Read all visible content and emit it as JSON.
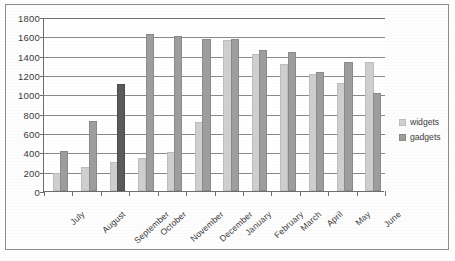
{
  "chart_data": {
    "type": "bar",
    "title": "",
    "xlabel": "",
    "ylabel": "",
    "ylim": [
      0,
      1800
    ],
    "ytick_step": 200,
    "yticks": [
      1800,
      1600,
      1400,
      1200,
      1000,
      800,
      600,
      400,
      200,
      0
    ],
    "grid": true,
    "legend_position": "right",
    "categories": [
      "July",
      "August",
      "September",
      "October",
      "November",
      "December",
      "January",
      "February",
      "March",
      "April",
      "May",
      "June"
    ],
    "series": [
      {
        "name": "widgets",
        "color": "#cfcfcf",
        "values": [
          170,
          230,
          280,
          320,
          380,
          690,
          1540,
          1400,
          1290,
          1190,
          1100,
          1310
        ]
      },
      {
        "name": "gadgets",
        "color": "#9e9e9e",
        "highlight_color": "#5b5b5b",
        "highlighted_category": "September",
        "values": [
          390,
          700,
          1090,
          1600,
          1580,
          1550,
          1550,
          1440,
          1420,
          1210,
          1310,
          990
        ]
      }
    ]
  },
  "legend": {
    "items": [
      {
        "label": "widgets",
        "swatch": "widgets"
      },
      {
        "label": "gadgets",
        "swatch": "gadgets"
      }
    ]
  }
}
